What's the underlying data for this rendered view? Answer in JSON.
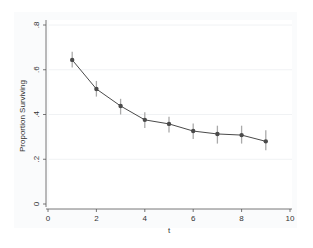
{
  "chart_data": {
    "type": "line",
    "title": "",
    "xlabel": "t",
    "ylabel": "Proportion Surviving",
    "xlim": [
      0,
      10
    ],
    "ylim": [
      0,
      0.8
    ],
    "xticks": [
      0,
      2,
      4,
      6,
      8,
      10
    ],
    "xtick_labels": [
      "0",
      "2",
      "4",
      "6",
      "8",
      "10"
    ],
    "yticks": [
      0,
      0.2,
      0.4,
      0.6,
      0.8
    ],
    "ytick_labels": [
      "0",
      ".2",
      ".4",
      ".6",
      ".8"
    ],
    "grid": "horizontal, faint",
    "legend": "none",
    "series": [
      {
        "name": "Proportion Surviving",
        "x": [
          1,
          2,
          3,
          4,
          5,
          6,
          7,
          8,
          9
        ],
        "values": [
          0.644,
          0.514,
          0.438,
          0.376,
          0.358,
          0.326,
          0.313,
          0.308,
          0.28
        ],
        "error_low": [
          0.61,
          0.48,
          0.4,
          0.34,
          0.32,
          0.29,
          0.27,
          0.27,
          0.24
        ],
        "error_high": [
          0.68,
          0.55,
          0.47,
          0.41,
          0.39,
          0.36,
          0.35,
          0.35,
          0.33
        ],
        "marker": "circle",
        "color": "#4a4a4a",
        "errorbar_color": "#aaaaaa"
      }
    ]
  }
}
